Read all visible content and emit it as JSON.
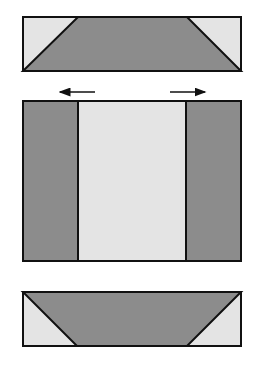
{
  "diagram": {
    "colors": {
      "dark_fill": "#8c8c8c",
      "light_fill": "#e4e4e4",
      "stroke": "#111111",
      "background": "#ffffff"
    },
    "top_panel": {
      "rect": {
        "x": 23,
        "y": 17,
        "w": 218,
        "h": 54
      },
      "trapezoid_top_left_x": 78,
      "trapezoid_top_right_x": 187
    },
    "arrows": [
      {
        "direction": "left",
        "x1": 95,
        "x2": 60,
        "y": 92
      },
      {
        "direction": "right",
        "x1": 170,
        "x2": 205,
        "y": 92
      }
    ],
    "middle_panel": {
      "rect": {
        "x": 23,
        "y": 101,
        "w": 218,
        "h": 160
      },
      "left_band_right_x": 78,
      "right_band_left_x": 186
    },
    "bottom_panel": {
      "rect": {
        "x": 23,
        "y": 292,
        "w": 218,
        "h": 54
      },
      "trapezoid_bottom_left_x": 77,
      "trapezoid_bottom_right_x": 187
    }
  }
}
